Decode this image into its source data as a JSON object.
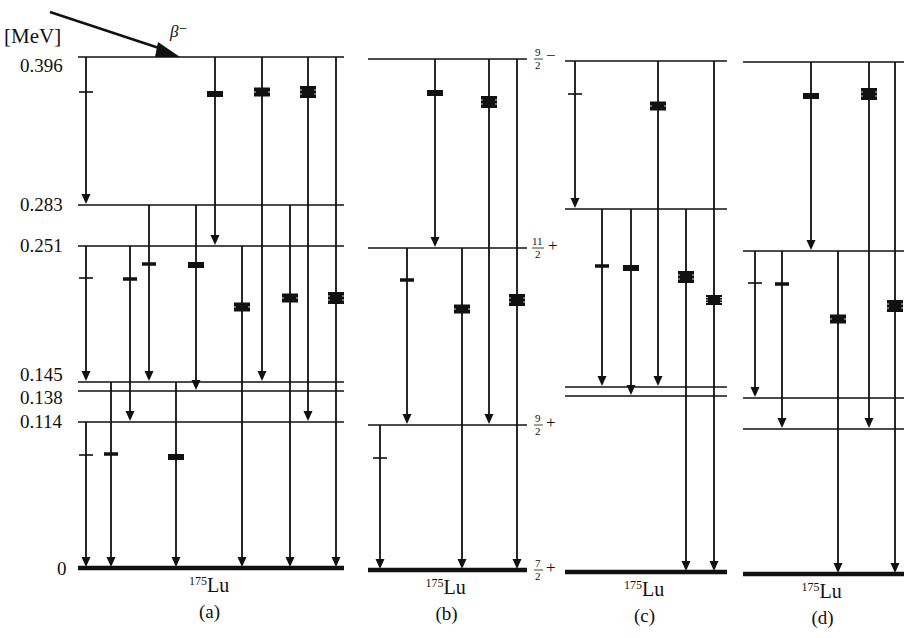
{
  "figure": {
    "unit_label": "[MeV]",
    "beta_label": "β⁻",
    "nuclide": {
      "mass": "175",
      "symbol": "Lu"
    },
    "energy_levels_mev": [
      "0.396",
      "0.283",
      "0.251",
      "0.145",
      "0.138",
      "0.114",
      "0"
    ],
    "spin_labels": [
      {
        "num": "9",
        "den": "2",
        "parity": "−",
        "level": "0.396"
      },
      {
        "num": "11",
        "den": "2",
        "parity": "+",
        "level": "0.251"
      },
      {
        "num": "9",
        "den": "2",
        "parity": "+",
        "level": "0.114"
      },
      {
        "num": "7",
        "den": "2",
        "parity": "+",
        "level": "0"
      }
    ],
    "panels": [
      {
        "id": "a",
        "label": "(a)",
        "x0": 78,
        "x1": 344,
        "levels": {
          "0.396": 57,
          "0.283": 205,
          "0.251": 246,
          "0.145": 382,
          "0.138": 391,
          "0.114": 422,
          "0": 568
        },
        "transitions": [
          {
            "x": 86,
            "from": "0.396",
            "to": "0.283",
            "marker": {
              "y": 92,
              "type": "tick"
            }
          },
          {
            "x": 215,
            "from": "0.396",
            "to": "0.251",
            "marker": {
              "y": 94,
              "type": "bar2"
            }
          },
          {
            "x": 262,
            "from": "0.396",
            "to": "0.145",
            "marker": {
              "y": 92,
              "type": "bar3"
            }
          },
          {
            "x": 308,
            "from": "0.396",
            "to": "0.114",
            "marker": {
              "y": 92,
              "type": "bar4"
            }
          },
          {
            "x": 336,
            "from": "0.396",
            "to": "0",
            "marker": {
              "y": 298,
              "type": "bar4"
            }
          },
          {
            "x": 149,
            "from": "0.283",
            "to": "0.145",
            "marker": {
              "y": 264,
              "type": "bar1"
            }
          },
          {
            "x": 196,
            "from": "0.283",
            "to": "0.138",
            "marker": {
              "y": 265,
              "type": "bar2"
            }
          },
          {
            "x": 290,
            "from": "0.283",
            "to": "0",
            "marker": {
              "y": 298,
              "type": "bar3"
            }
          },
          {
            "x": 86,
            "from": "0.251",
            "to": "0.145",
            "marker": {
              "y": 278,
              "type": "tick"
            }
          },
          {
            "x": 130,
            "from": "0.251",
            "to": "0.114",
            "marker": {
              "y": 279,
              "type": "bar1"
            }
          },
          {
            "x": 242,
            "from": "0.251",
            "to": "0",
            "marker": {
              "y": 307,
              "type": "bar3"
            }
          },
          {
            "x": 86,
            "from": "0.114",
            "to": "0",
            "marker": {
              "y": 455,
              "type": "tick"
            }
          },
          {
            "x": 111,
            "from": "0.145",
            "to": "0",
            "marker": {
              "y": 454,
              "type": "bar1"
            }
          },
          {
            "x": 176,
            "from": "0.145",
            "to": "0",
            "marker": {
              "y": 457,
              "type": "bar2"
            }
          }
        ]
      },
      {
        "id": "b",
        "label": "(b)",
        "x0": 368,
        "x1": 527,
        "levels": {
          "0.396": 59,
          "0.251": 248,
          "0.114": 425,
          "0": 570
        },
        "transitions": [
          {
            "x": 435,
            "from": "0.396",
            "to": "0.251",
            "marker": {
              "y": 93,
              "type": "bar2"
            }
          },
          {
            "x": 489,
            "from": "0.396",
            "to": "0.114",
            "marker": {
              "y": 102,
              "type": "bar4"
            }
          },
          {
            "x": 517,
            "from": "0.396",
            "to": "0",
            "marker": {
              "y": 300,
              "type": "bar4"
            }
          },
          {
            "x": 407,
            "from": "0.251",
            "to": "0.114",
            "marker": {
              "y": 280,
              "type": "bar1"
            }
          },
          {
            "x": 462,
            "from": "0.251",
            "to": "0",
            "marker": {
              "y": 309,
              "type": "bar3"
            }
          },
          {
            "x": 380,
            "from": "0.114",
            "to": "0",
            "marker": {
              "y": 458,
              "type": "tick"
            }
          }
        ]
      },
      {
        "id": "c",
        "label": "(c)",
        "x0": 565,
        "x1": 727,
        "levels": {
          "0.396": 61,
          "0.283": 209,
          "0.145": 387,
          "0.138": 396,
          "0": 572
        },
        "transitions": [
          {
            "x": 575,
            "from": "0.396",
            "to": "0.283",
            "marker": {
              "y": 94,
              "type": "tick"
            }
          },
          {
            "x": 658,
            "from": "0.396",
            "to": "0.145",
            "marker": {
              "y": 106,
              "type": "bar3"
            }
          },
          {
            "x": 714,
            "from": "0.396",
            "to": "0",
            "marker": {
              "y": 300,
              "type": "bar5"
            }
          },
          {
            "x": 602,
            "from": "0.283",
            "to": "0.145",
            "marker": {
              "y": 266,
              "type": "bar1"
            }
          },
          {
            "x": 631,
            "from": "0.283",
            "to": "0.138",
            "marker": {
              "y": 268,
              "type": "bar2"
            }
          },
          {
            "x": 686,
            "from": "0.283",
            "to": "0",
            "marker": {
              "y": 277,
              "type": "bar4"
            }
          }
        ]
      },
      {
        "id": "d",
        "label": "(d)",
        "x0": 743,
        "x1": 904,
        "levels": {
          "0.396": 62,
          "0.251": 251,
          "0.145": 398,
          "0.114": 429,
          "0": 574
        },
        "transitions": [
          {
            "x": 811,
            "from": "0.396",
            "to": "0.251",
            "marker": {
              "y": 96,
              "type": "bar2"
            }
          },
          {
            "x": 869,
            "from": "0.396",
            "to": "0.114",
            "marker": {
              "y": 94,
              "type": "bar4"
            }
          },
          {
            "x": 895,
            "from": "0.396",
            "to": "0",
            "marker": {
              "y": 306,
              "type": "bar4"
            }
          },
          {
            "x": 755,
            "from": "0.251",
            "to": "0.145",
            "marker": {
              "y": 283,
              "type": "tick"
            }
          },
          {
            "x": 782,
            "from": "0.251",
            "to": "0.114",
            "marker": {
              "y": 284,
              "type": "bar1"
            }
          },
          {
            "x": 838,
            "from": "0.251",
            "to": "0",
            "marker": {
              "y": 319,
              "type": "bar3"
            }
          }
        ]
      }
    ],
    "colors": {
      "ink": "#111111",
      "background": "#ffffff"
    }
  }
}
